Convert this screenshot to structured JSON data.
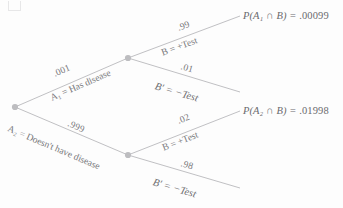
{
  "diagram": {
    "type": "probability-tree",
    "title": "",
    "line_color": "#b9b9bc",
    "node_color": "#bdbdc0",
    "text_color": "#77777a",
    "nodes": [
      {
        "id": "root",
        "x": 15,
        "y": 107
      },
      {
        "id": "a1",
        "x": 128,
        "y": 58
      },
      {
        "id": "a2",
        "x": 128,
        "y": 155
      }
    ],
    "branches": [
      {
        "id": "root-a1",
        "probability": ".001",
        "event_label": "A₁ = Has disease",
        "from": "root",
        "to": "a1"
      },
      {
        "id": "root-a2",
        "probability": ".999",
        "event_label": "A₂ = Doesn't have disease",
        "from": "root",
        "to": "a2"
      },
      {
        "id": "a1-b",
        "probability": ".99",
        "event_label": "B = +Test",
        "from": "a1",
        "to": "a1-pos"
      },
      {
        "id": "a1-bprime",
        "probability": ".01",
        "event_label": "B′ = −Test",
        "from": "a1",
        "to": "a1-neg"
      },
      {
        "id": "a2-b",
        "probability": ".02",
        "event_label": "B = +Test",
        "from": "a2",
        "to": "a2-pos"
      },
      {
        "id": "a2-bprime",
        "probability": ".98",
        "event_label": "B′ = −Test",
        "from": "a2",
        "to": "a2-neg"
      }
    ],
    "results": [
      {
        "id": "result-a1",
        "expression": "P(A₁ ∩ B) =",
        "value": ".00099"
      },
      {
        "id": "result-a2",
        "expression": "P(A₂ ∩ B) =",
        "value": ".01998"
      }
    ]
  }
}
